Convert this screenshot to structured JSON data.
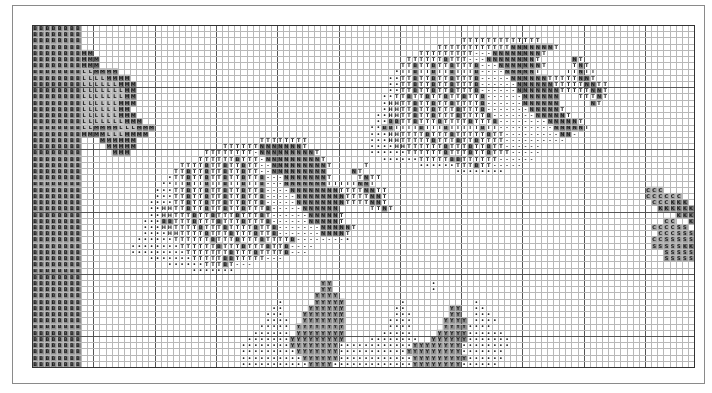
{
  "chart": {
    "title": "",
    "type": "cross-stitch pattern chart",
    "cols": 108,
    "rows": 55,
    "cell_w": 6.13,
    "cell_h": 6.22,
    "major_every": 10
  },
  "colors": {
    "minor_line": "#b8b8b8",
    "major_line": "#555555",
    "border": "#333333",
    "frame": "#8a8a8a",
    "dark_fill": "#7a7a7a",
    "mid_fill": "#a5a5a5",
    "light_fill": "#cfcfcf",
    "symbol_dark": "#1a1a1a"
  },
  "legend": {
    "B": {
      "fill": "#8d8d8d",
      "glyph": "B"
    },
    "M": {
      "fill": "#7a7a7a",
      "glyph": "M"
    },
    "L": {
      "fill": "#bdbdbd",
      "glyph": "L"
    },
    "T": {
      "fill": "#ffffff",
      "glyph": "T"
    },
    "b": {
      "fill": "#8d8d8d",
      "glyph": "B"
    },
    "N": {
      "fill": "#7d7d7d",
      "glyph": "N"
    },
    "H": {
      "fill": "#ffffff",
      "glyph": "H"
    },
    "o": {
      "fill": "#ffffff",
      "glyph": "•"
    },
    "-": {
      "fill": "#ffffff",
      "glyph": "-"
    },
    "Y": {
      "fill": "#8f8f8f",
      "glyph": "Y"
    },
    "C": {
      "fill": "#a8a8a8",
      "glyph": "C"
    },
    "K": {
      "fill": "#7d7d7d",
      "glyph": "K"
    },
    "S": {
      "fill": "#9a9a9a",
      "glyph": "S"
    }
  },
  "pattern": [
    "BBBBBBBB........................................................................................................",
    "BBBBBBBB........................................................................................................",
    "BBBBBBBB..............................................................TTTTTTTTTTTTT.............................",
    "BBBBBBBB..........................................................TTTTTTTTTTTTNNNNNNNT............................",
    "BBBBBBBBMM.....................................................TTTTTTTTT---NNNNNNNNT............................",
    "BBBBBBBBMMM..................................................TTTTTTbTTT---NNNNNNNNT.....NT.......................",
    "BBBBBBBBMMM.................................................TTbTTbTTbTTTb---NNNNNNNT....TNT.....................",
    "BBBBBBBBLLMMMM.............................................oTTbTTbTTbTTTb----NNNNNT....TTNTT....................",
    "BBBBBBBBLLLLMMMM..........................................ooTTbTTbTTbTTTb-----NNNNNNTTTTTNNT...................",
    "BBBBBBBBLLLLLLMMM.........................................ooTTbTTbTTbTTTb------NNNNNNTTTTTNNTT..................",
    "BBBBBBBBLLLLLLLMM.........................................ooTTbTTbTTbTTTb------NNNNNNNTTTTTNNT..................",
    "BBBBBBBBLLLLLLLMM........................................ooTTbTTbTTbTTbTTb------NNNNNN...TTTNT..................",
    "BBBBBBBBLLLLLLMMM........................................oHHTTbTTbTTbTTTTb------NNNNNN.....NT..................",
    "BBBBBBBBLLLLLLMM.........................................oHHTTbTTbTTTbTTTb-------NNNNNT.........................",
    "BBBBBBBBLLLLLLMMM.......................................ooHHTTbTTbTTTbTTTTb-------NNNNNT........................",
    "BBBBBBBBLLLLLLLMMM......................................oobbTTbTTTbTTTTbTTTb--------NNNNNT......................",
    "BBBBBBBBLLMMMMLLLMMM...................................oobbTTTTbTTTbTTTTTbTT---------NNNNNT.....................",
    "BBBBBBBBMMMMLLLMMMM....................................oooHHTTTTbTTTbTTTTTbTT---------NN-.......................",
    "BBBBBBBB...MMMMMM....................TTTTTTTT..........oooHHTTTTTbTTTbTTbTTTT----------..........................",
    "BBBBBBBB....MMMMM..............TTTTTTNNNNNNNT..........ooooHHTTTTTTbTTTbTTbTT------...........................",
    "BBBBBBBB.....MMM............TTTTTTTT-NNNNNNNNNT........ooooooTTTTTTbTTTbTTbTTT-----.............................",
    "BBBBBBBB...................TTTTTTbTTT-NNNNNNNNNT.........ooooooTTTTTbbTTTTTT------..............................",
    "BBBBBBBB................TTTTbTTbTTbTT--NNNNNNNNNT.....T........ooooooTTTbTT-----..................................",
    "BBBBBBBB...............TTbTTbTTbTTbTT--NNNNNNNNN....NT...............oooooooo.....................................",
    "BBBBBBBB..............oTTbTTbTTbTTbTTb---NNNNNNNT....TNTT.....................................................CC",
    "BBBBBBBB.............ooTTbTTbTTbTTbTTb---NNNNNNNTTTTTNNT.....................................................CC",
    "BBBBBBBB............oooTTbTTbTTbTTbTTb----NNNNNNNNTTTTNNTT..........................................CCC.......SS",
    "BBBBBBBB............oooTTbTTbTTbTTbTTb-----NNNNNNNNTTTTNNT..........................................CCCCCC....SS",
    "BBBBBBBB...........ooooTTbTTbTTbTTbTTb-----NNNNNNNNTTTTNNT...........................................CCCKKK...SS",
    "BBBBBBBB...........ooHHTTbTTbTTbTTbTTTb-----NNNNNN.....TTNT...........................................KKKKKKK.SS",
    "BBBBBBBB...........ooHHTTTbTTbTTTbTTTbT------NNNNNT......................................................KKKKKKKSS",
    "BBBBBBBB..........ooobbTTTbTTTbTTTbTTTb------NNNNNT....................................................CC..KKKKKSS",
    "BBBBBBBB..........oooHHTTTTbTTTbTTTTbTTb-------NNNNNT................................................CCCCSS.KKKKSS",
    "BBBBBBBB..........ooooHHTTTTbTTTbTTTbTTb-------NNNNT..................................................CCCSSSSSKKKKS",
    "BBBBBBBB.........ooooooTTTTTTbTTTbTTTbTTTTb--------o.................................................CCSSSSSKKKKSS",
    "BBBBBBBB........ooooooooTTTTTTbTTTbTTTbTTb----.......................................................SSSSSKKKKS",
    "BBBBBBBB........oooooooooTTTTTTTbTTTbTTTTb---..........................................................SSSSSSSSS",
    "BBBBBBBB...........oooooooTTTTTbbTTTTT---..............................................................SSSSSSS",
    "BBBBBBBB..............ooooooTTTbT---...........................................................................SSS",
    "BBBBBBBB..................ooooooo...................................................................................CS",
    "BBBBBBBB.......................................................................................................C",
    "BBBBBBBB.......................................YY................o.............................................CC",
    "BBBBBBBB.......................................YY................o...............................................CC",
    "BBBBBBBB......................................YYYY..............................................................CCC",
    "BBBBBBBB................................o.....YYYYY.........o...........o.......................................CCC",
    "BBBBBBBB...............................oo....YYYYYY........oo.......YY..oo......................................CCC",
    "BBBBBBBB..............................ooo...YYYYYYY........ooo......YY..ooo.....................................CCCC",
    "BBBBBBBB..............................oooo..YYYYYYY.......oooo.....YYYY.oooo....................................CCCC",
    "BBBBBBBB.............................ooooo.YYYYYYYY.......oooo.....YYYYoooo.....................................CCCCC",
    "BBBBBBBB............................oooooo.YYYYYYYY......ooooo....YYYYYoooooo..................................CCCCCC",
    "BBBBBBBB...........................oooooooYYYYYYYYY....oooooooo..YYYYYYooooooo.................................CCCCCCC",
    "BBBBBBBB..........................ooooooooYYYYYYYYooooooooooooYYYYYYYYoooooooo.................................CCCCCCC",
    "BBBBBBBB..........................oooooooooYYYYYYYoooooooooooYYYYYYYYYooooooo..................................CCCCCCC",
    "BBBBBBBB..........................ooooooooooYYYYYYooooooooooooYYYYYYYYYoooooo...................................CCCCCCC",
    "BBBBBBBB..........................oooooooooooYYYYoooooooooooooYYYYYYYYoooooo...................................CCCCCCC"
  ]
}
